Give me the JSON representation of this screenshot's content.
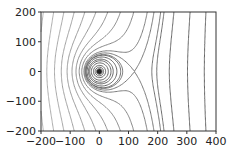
{
  "chart_data": {
    "type": "contour",
    "title": "",
    "xlabel": "",
    "ylabel": "",
    "xlim": [
      -200,
      400
    ],
    "ylim": [
      -200,
      200
    ],
    "x_ticks": [
      "−200",
      "−100",
      "0",
      "100",
      "200",
      "300",
      "400"
    ],
    "y_ticks": [
      "200",
      "100",
      "0",
      "−100",
      "−200"
    ],
    "x_tick_values": [
      -200,
      -100,
      0,
      100,
      200,
      300,
      400
    ],
    "y_tick_values": [
      200,
      100,
      0,
      -100,
      -200
    ],
    "grid": false,
    "legend": null,
    "colormap": "greys",
    "field": "x + a/r (point source at origin plus uniform field)",
    "source_point": [
      0,
      0
    ],
    "saddle_point_approx": [
      120,
      0
    ],
    "levels": [
      -380,
      -340,
      -300,
      -260,
      -220,
      -180,
      -140,
      -100,
      -60,
      -20,
      20,
      60,
      100,
      140,
      180,
      220,
      240,
      260,
      270,
      300,
      350,
      400,
      500,
      700,
      1000,
      1500
    ],
    "line_color_light": "#d0d0d0",
    "line_color_dark": "#555555"
  }
}
